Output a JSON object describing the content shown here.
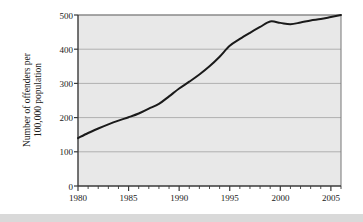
{
  "figure": {
    "name": "offenders-rate-line-chart",
    "background_color": "#ffffff",
    "plot_background_color": "#e8e8e8",
    "line_color": "#1a1a1a",
    "grid_color": "#b0b0b0",
    "axis_color": "#555555"
  },
  "axis": {
    "y_label_line1": "Number of offenders per",
    "y_label_line2": "100,000 population",
    "y_ticks": [
      "0",
      "100",
      "200",
      "300",
      "400",
      "500"
    ],
    "x_ticks": [
      "1980",
      "1985",
      "1990",
      "1995",
      "2000",
      "2005"
    ]
  },
  "chart_data": {
    "type": "line",
    "title": "",
    "subtitle": "",
    "xlabel": "",
    "ylabel": "Number of offenders per 100,000 population",
    "xlim": [
      1980,
      2006
    ],
    "ylim": [
      0,
      500
    ],
    "xticks": [
      1980,
      1985,
      1990,
      1995,
      2000,
      2005
    ],
    "yticks": [
      0,
      100,
      200,
      300,
      400,
      500
    ],
    "x_minor_tick_interval": 1,
    "grid": true,
    "grid_axis": "y",
    "legend": false,
    "legend_position": "none",
    "x": [
      1980,
      1981,
      1982,
      1983,
      1984,
      1985,
      1986,
      1987,
      1988,
      1989,
      1990,
      1991,
      1992,
      1993,
      1994,
      1995,
      1996,
      1997,
      1998,
      1999,
      2000,
      2001,
      2002,
      2003,
      2004,
      2005,
      2006
    ],
    "values": [
      140,
      155,
      168,
      180,
      191,
      201,
      212,
      226,
      240,
      262,
      285,
      305,
      326,
      350,
      378,
      410,
      430,
      448,
      465,
      481,
      477,
      473,
      478,
      484,
      488,
      494,
      500
    ],
    "series": [
      {
        "name": "Number of offenders per 100,000 population",
        "values": [
          140,
          155,
          168,
          180,
          191,
          201,
          212,
          226,
          240,
          262,
          285,
          305,
          326,
          350,
          378,
          410,
          430,
          448,
          465,
          481,
          477,
          473,
          478,
          484,
          488,
          494,
          500
        ]
      }
    ]
  }
}
